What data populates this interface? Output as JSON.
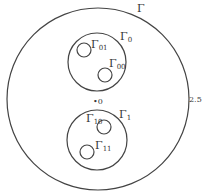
{
  "diagram": {
    "outer": {
      "label": "Γ",
      "radius_label": "2.5"
    },
    "origin_label": "•0",
    "groups": [
      {
        "label": "Γ",
        "sub": "0",
        "children": [
          {
            "label": "Γ",
            "sub": "01"
          },
          {
            "label": "Γ",
            "sub": "00"
          }
        ]
      },
      {
        "label": "Γ",
        "sub": "1",
        "children": [
          {
            "label": "Γ",
            "sub": "10"
          },
          {
            "label": "Γ",
            "sub": "11"
          }
        ]
      }
    ]
  }
}
